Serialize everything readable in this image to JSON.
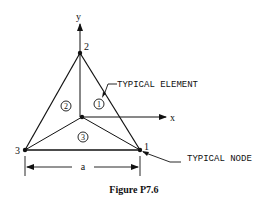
{
  "figure": {
    "caption": "Figure P7.6",
    "axes": {
      "x_label": "x",
      "y_label": "y"
    },
    "nodes": [
      {
        "id": "1",
        "label": "1"
      },
      {
        "id": "2",
        "label": "2"
      },
      {
        "id": "3",
        "label": "3"
      }
    ],
    "elements": [
      {
        "id": "1",
        "label": "1"
      },
      {
        "id": "2",
        "label": "2"
      },
      {
        "id": "3",
        "label": "3"
      }
    ],
    "annotations": {
      "typical_element": "TYPICAL ELEMENT",
      "typical_node": "TYPICAL NODE"
    },
    "dimension": {
      "label": "a"
    }
  }
}
